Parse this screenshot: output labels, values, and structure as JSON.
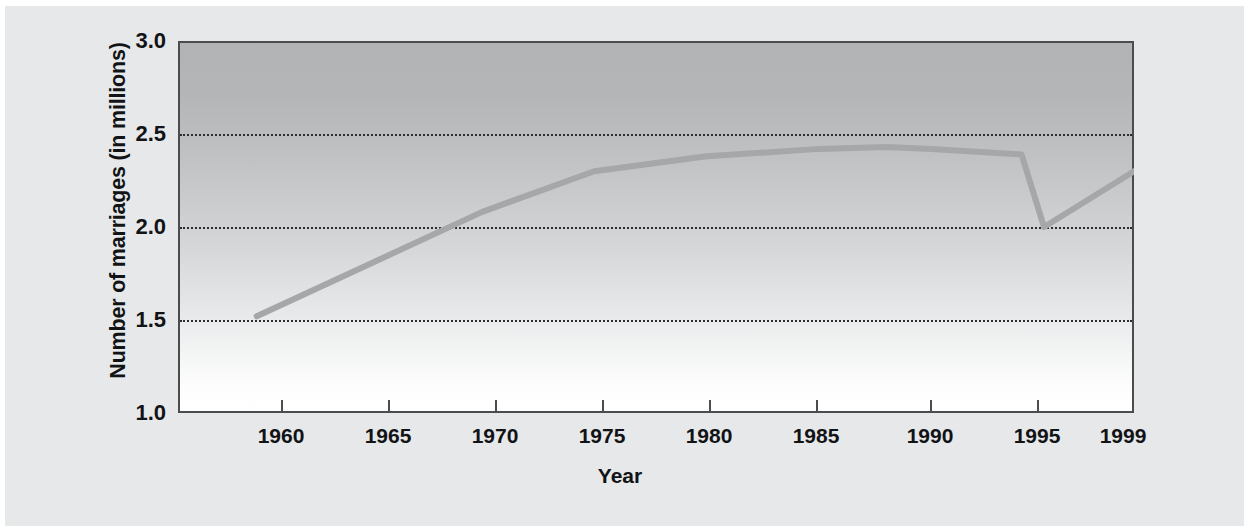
{
  "chart_data": {
    "type": "line",
    "title": "",
    "xlabel": "Year",
    "ylabel": "Number of marriages (in millions)",
    "xlim": [
      1956.5,
      1999
    ],
    "ylim": [
      1.0,
      3.0
    ],
    "grid": true,
    "gridlines_y": [
      1.5,
      2.0,
      2.5
    ],
    "legend": "none",
    "xticks": [
      1960,
      1965,
      1970,
      1975,
      1980,
      1985,
      1990,
      1995,
      1999
    ],
    "xticklabels": [
      "1960",
      "1965",
      "1970",
      "1975",
      "1980",
      "1985",
      "1990",
      "1995",
      "1999"
    ],
    "yticks": [
      1.0,
      1.5,
      2.0,
      2.5,
      3.0
    ],
    "yticklabels": [
      "1.0",
      "1.5",
      "2.0",
      "2.5",
      "3.0"
    ],
    "series": [
      {
        "name": "Number of marriages",
        "color": "#a6a7a8",
        "x": [
          1960,
          1965,
          1970,
          1975,
          1980,
          1985,
          1988,
          1990,
          1994,
          1995,
          1999
        ],
        "values": [
          1.52,
          1.8,
          2.08,
          2.3,
          2.38,
          2.42,
          2.43,
          2.42,
          2.39,
          2.0,
          2.3
        ]
      }
    ]
  },
  "axes": {
    "ylabel": "Number of marriages (in millions)",
    "xlabel": "Year",
    "yticklabels": [
      "3.0",
      "2.5",
      "2.0",
      "1.5",
      "1.0"
    ],
    "xticklabels": [
      "1960",
      "1965",
      "1970",
      "1975",
      "1980",
      "1985",
      "1990",
      "1995",
      "1999"
    ]
  },
  "colors": {
    "line": "#a6a7a8",
    "frame": "#4a4d50",
    "grid": "#2a2c2e",
    "panel_background": "#e7e8e9",
    "plot_top": "#b2b3b4",
    "plot_bottom": "#ffffff",
    "text": "#111316"
  }
}
